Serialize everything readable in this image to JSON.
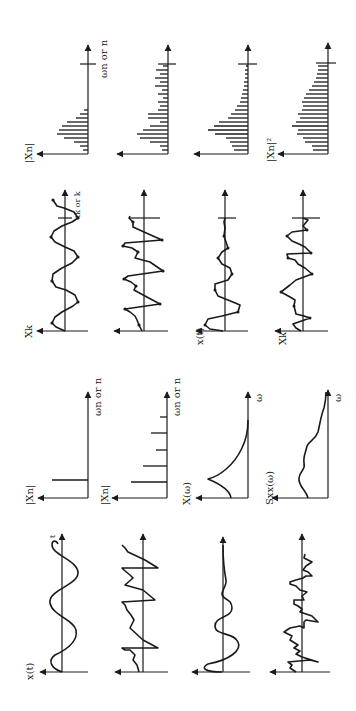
{
  "figure": {
    "orientation": "rotated 90° counter-clockwise",
    "rows": [
      {
        "name": "sine",
        "continuous_signal": {
          "ylabel": "x(t)",
          "xlabel": "t"
        },
        "continuous_spectrum": {
          "ylabel": "|Xn|",
          "xlabel": "ωn or n",
          "type": "single line"
        },
        "sampled_signal": {
          "ylabel": "Xk",
          "xlabel": "tk or k"
        },
        "discrete_spectrum": {
          "ylabel": "|Xn|",
          "xlabel": "ωn or n",
          "type": "leaking lines around peak"
        }
      },
      {
        "name": "periodic",
        "continuous_signal": {
          "ylabel": "",
          "xlabel": ""
        },
        "continuous_spectrum": {
          "ylabel": "|Xn|",
          "xlabel": "ωn or n",
          "type": "harmonic lines"
        },
        "sampled_signal": {
          "ylabel": "",
          "xlabel": ""
        },
        "discrete_spectrum": {
          "ylabel": "",
          "xlabel": "",
          "type": "harmonic lines with leakage"
        }
      },
      {
        "name": "transient",
        "continuous_signal": {
          "ylabel": "",
          "xlabel": ""
        },
        "continuous_spectrum": {
          "ylabel": "X(ω)",
          "xlabel": "ω",
          "type": "continuous peak"
        },
        "sampled_signal": {
          "ylabel": "x(t)",
          "xlabel": ""
        },
        "discrete_spectrum": {
          "ylabel": "",
          "xlabel": "",
          "type": "decaying lines"
        }
      },
      {
        "name": "random",
        "continuous_signal": {
          "ylabel": "",
          "xlabel": ""
        },
        "continuous_spectrum": {
          "ylabel": "Sxx(ω)",
          "xlabel": "ω",
          "type": "continuous broadband"
        },
        "sampled_signal": {
          "ylabel": "Xk",
          "xlabel": ""
        },
        "discrete_spectrum": {
          "ylabel": "|Xn|²",
          "xlabel": "",
          "type": "broadband lines"
        }
      }
    ]
  },
  "labels": {
    "xt": "x(t)",
    "t": "t",
    "xn_abs": "|Xn|",
    "wn_or_n": "ωn or n",
    "X_w": "X(ω)",
    "Sxx_w": "Sxx(ω)",
    "omega": "ω",
    "xk": "Xk",
    "tk_or_k": "tk or k",
    "xn_abs_sq": "|Xn|²"
  }
}
